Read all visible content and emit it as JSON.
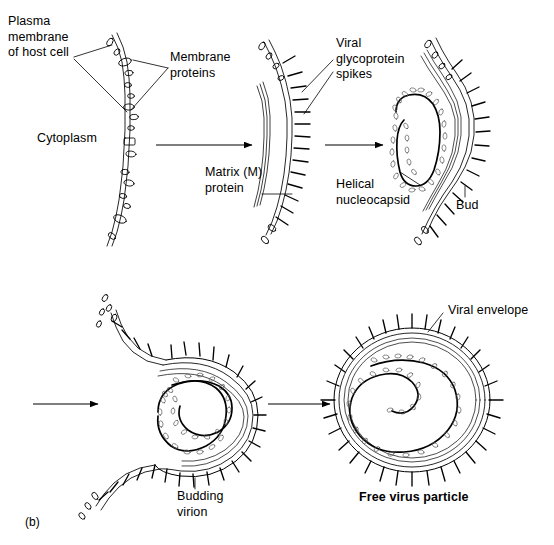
{
  "figure": {
    "panel_label": "(b)",
    "type": "biological-process-diagram",
    "stages": 5,
    "background_color": "#ffffff",
    "ink_color": "#000000"
  },
  "labels": {
    "plasma_membrane": "Plasma\nmembrane\nof host cell",
    "membrane_proteins": "Membrane\nproteins",
    "cytoplasm": "Cytoplasm",
    "matrix_protein": "Matrix (M)\nprotein",
    "viral_glycoprotein_spikes": "Viral\nglycoprotein\nspikes",
    "helical_nucleocapsid": "Helical\nnucleocapsid",
    "bud": "Bud",
    "budding_virion": "Budding\nvirion",
    "viral_envelope": "Viral envelope",
    "free_virus_particle": "Free virus particle"
  },
  "stage_names": [
    "host-cell-membrane",
    "membrane-with-spikes-and-matrix",
    "nucleocapsid-bud",
    "budding-virion",
    "free-virus-particle"
  ],
  "arrows": [
    {
      "name": "arrow-stage1-to-stage2",
      "x1": 156,
      "y1": 145,
      "x2": 252,
      "y2": 145
    },
    {
      "name": "arrow-stage2-to-stage3",
      "x1": 325,
      "y1": 145,
      "x2": 383,
      "y2": 145
    },
    {
      "name": "arrow-stage3-to-stage4",
      "x1": 33,
      "y1": 404,
      "x2": 98,
      "y2": 404
    },
    {
      "name": "arrow-stage4-to-stage5",
      "x1": 268,
      "y1": 404,
      "x2": 330,
      "y2": 404
    }
  ]
}
